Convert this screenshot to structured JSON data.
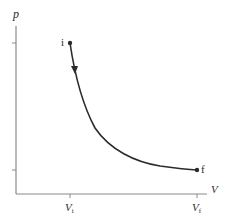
{
  "diagram": {
    "type": "pV-diagram",
    "axes": {
      "y_label": "p",
      "x_label": "V"
    },
    "x_ticks": [
      {
        "label_main": "V",
        "label_sub": "i"
      },
      {
        "label_main": "V",
        "label_sub": "f"
      }
    ],
    "points": {
      "initial": {
        "label": "i"
      },
      "final": {
        "label": "f"
      }
    },
    "process": {
      "direction": "from i to f",
      "arrow": "downward along curve"
    },
    "colors": {
      "axis": "#8a8a8a",
      "curve": "#2b2b2b",
      "text": "#2b2b2b",
      "background": "#ffffff"
    }
  }
}
